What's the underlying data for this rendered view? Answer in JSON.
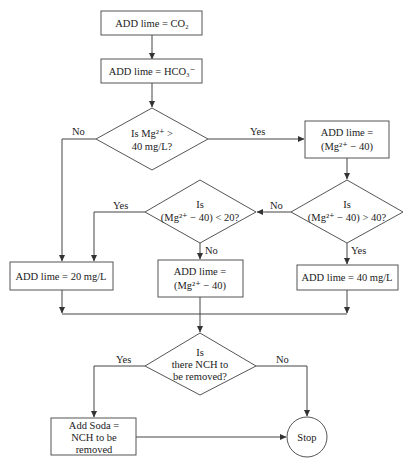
{
  "diagram": {
    "type": "flowchart",
    "nodes": {
      "add_co2": {
        "kind": "process",
        "lines": [
          "ADD lime = CO",
          "2"
        ],
        "text": "ADD lime = CO₂"
      },
      "add_hco3": {
        "kind": "process",
        "text": "ADD lime = HCO₃⁻"
      },
      "dec_mg40": {
        "kind": "decision",
        "line1": "Is Mg²⁺ >",
        "line2": "40 mg/L?"
      },
      "add_mg_minus40_top": {
        "kind": "process",
        "line1": "ADD lime =",
        "line2": "(Mg²⁺ − 40)"
      },
      "dec_gt40": {
        "kind": "decision",
        "line1": "Is",
        "line2": "(Mg²⁺ − 40) > 40?"
      },
      "dec_lt20": {
        "kind": "decision",
        "line1": "Is",
        "line2": "(Mg²⁺ − 40) < 20?"
      },
      "add_20": {
        "kind": "process",
        "text": "ADD lime = 20 mg/L"
      },
      "add_mg_minus40_mid": {
        "kind": "process",
        "line1": "ADD lime =",
        "line2": "(Mg²⁺ − 40)"
      },
      "add_40": {
        "kind": "process",
        "text": "ADD lime = 40 mg/L"
      },
      "dec_nch": {
        "kind": "decision",
        "line1": "Is",
        "line2": "there NCH to",
        "line3": "be removed?"
      },
      "add_soda": {
        "kind": "process",
        "line1": "Add Soda =",
        "line2": "NCH to be",
        "line3": "removed"
      },
      "stop": {
        "kind": "terminal",
        "text": "Stop"
      }
    },
    "edge_labels": {
      "mg40_no": "No",
      "mg40_yes": "Yes",
      "gt40_no": "No",
      "gt40_yes": "Yes",
      "lt20_yes": "Yes",
      "lt20_no": "No",
      "nch_yes": "Yes",
      "nch_no": "No"
    },
    "edges": [
      {
        "from": "add_co2",
        "to": "add_hco3"
      },
      {
        "from": "add_hco3",
        "to": "dec_mg40"
      },
      {
        "from": "dec_mg40",
        "to": "add_20",
        "label": "No"
      },
      {
        "from": "dec_mg40",
        "to": "add_mg_minus40_top",
        "label": "Yes"
      },
      {
        "from": "add_mg_minus40_top",
        "to": "dec_gt40"
      },
      {
        "from": "dec_gt40",
        "to": "dec_lt20",
        "label": "No"
      },
      {
        "from": "dec_gt40",
        "to": "add_40",
        "label": "Yes"
      },
      {
        "from": "dec_lt20",
        "to": "add_20",
        "label": "Yes"
      },
      {
        "from": "dec_lt20",
        "to": "add_mg_minus40_mid",
        "label": "No"
      },
      {
        "from": "add_20",
        "to": "dec_nch"
      },
      {
        "from": "add_mg_minus40_mid",
        "to": "dec_nch"
      },
      {
        "from": "add_40",
        "to": "dec_nch"
      },
      {
        "from": "dec_nch",
        "to": "add_soda",
        "label": "Yes"
      },
      {
        "from": "dec_nch",
        "to": "stop",
        "label": "No"
      },
      {
        "from": "add_soda",
        "to": "stop"
      }
    ]
  }
}
